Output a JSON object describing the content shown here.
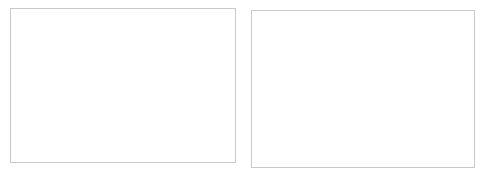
{
  "figure": {
    "panels": [
      {
        "name": "scree-plot",
        "title": "Eigen values",
        "xlabel": "Number of components",
        "annotations": [
          {
            "text": "Kaiser's rul"
          },
          {
            "text": "Broken-stick model"
          }
        ]
      },
      {
        "name": "loadings-plot",
        "legend": [
          {
            "label": "PC1",
            "marker": "diamond-marker-icon"
          },
          {
            "label": "PC2",
            "marker": "triangle-marker-icon"
          }
        ]
      }
    ]
  },
  "chart_data": [
    {
      "type": "line",
      "name": "scree-plot",
      "title": "Eigen values",
      "xlabel": "Number of components",
      "ylabel": "",
      "x": [
        1,
        2,
        3,
        4,
        5,
        6,
        7
      ],
      "xticklabels": [
        "1",
        "2",
        "3",
        "4",
        "5",
        "6",
        "7"
      ],
      "yticklabels": [
        "0",
        "0.05",
        "0.1",
        "0.15",
        "0.2",
        "0.25",
        "0.3",
        "0.35",
        "0.4",
        "0.45"
      ],
      "yticks": [
        0,
        0.05,
        0.1,
        0.15,
        0.2,
        0.25,
        0.3,
        0.35,
        0.4,
        0.45
      ],
      "ylim": [
        0,
        0.45
      ],
      "xlim": [
        1,
        7
      ],
      "grid": true,
      "legend": "none",
      "series": [
        {
          "name": "Eigen values",
          "style": "solid-with-diamond-markers",
          "values": [
            0.4,
            0.25,
            0.145,
            0.115,
            0.078,
            0.012,
            0.006
          ]
        },
        {
          "name": "Broken-stick model",
          "style": "dashed",
          "values": [
            0.37,
            0.235,
            0.145,
            0.108,
            0.077,
            0.042,
            0.018
          ]
        },
        {
          "name": "Kaiser's rul",
          "style": "dashed-horizontal",
          "values": [
            0.143,
            0.143,
            0.143,
            0.143,
            0.143,
            0.143,
            0.143
          ]
        }
      ],
      "annotations": [
        {
          "text": "Kaiser's rul",
          "x": 5.3,
          "y": 0.205
        },
        {
          "text": "Broken-stick model",
          "x": 4.7,
          "y": 0.108
        }
      ]
    },
    {
      "type": "line",
      "name": "loadings-plot",
      "title": "",
      "xlabel": "",
      "ylabel": "",
      "categories": [
        "Pop",
        "TFire_event",
        "NFire_event",
        "Munic_event",
        "Flood_event",
        "Nat_event",
        "Tech_event"
      ],
      "yticklabels": [
        "0,6",
        "0,4",
        "0,2",
        "0",
        "-0,2",
        "-0,4",
        "-0,6",
        "-0,8",
        "-1,0"
      ],
      "yticks": [
        0.6,
        0.4,
        0.2,
        0,
        -0.2,
        -0.4,
        -0.6,
        -0.8,
        -1.0
      ],
      "ylim": [
        -1.0,
        0.6
      ],
      "grid": true,
      "legend_position": "bottom",
      "series": [
        {
          "name": "PC1",
          "marker": "diamond",
          "values": [
            0.51,
            0.52,
            0.07,
            0.5,
            0.21,
            0.07,
            0.39
          ]
        },
        {
          "name": "PC2",
          "marker": "triangle",
          "values": [
            0.1,
            0.08,
            0.45,
            0.08,
            -0.36,
            -0.82,
            -0.12
          ]
        }
      ]
    }
  ]
}
